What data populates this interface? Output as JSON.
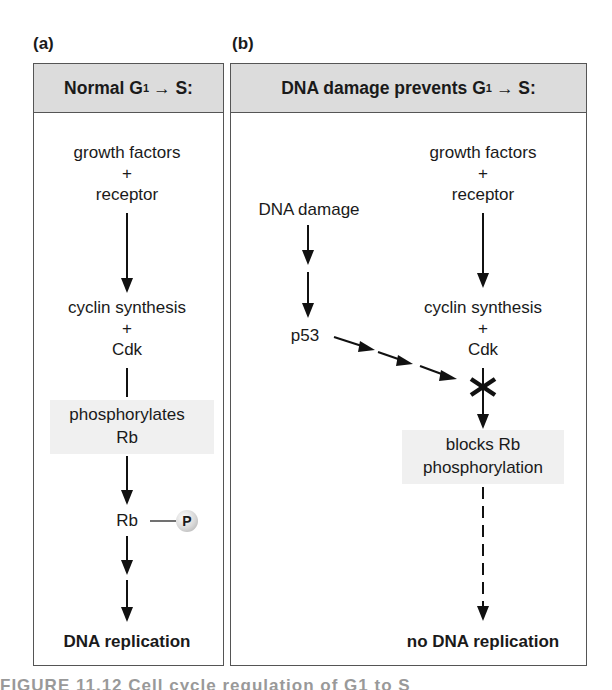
{
  "panel_a": {
    "label": "(a)",
    "header_pre": "Normal G",
    "header_sub": "1",
    "header_post": "→ S:",
    "steps": {
      "growth_factors": "growth factors",
      "plus1": "+",
      "receptor": "receptor",
      "cyclin_synthesis": "cyclin synthesis",
      "plus2": "+",
      "cdk": "Cdk",
      "phosphorylates": "phosphorylates",
      "rb": "Rb",
      "rb_p": "Rb",
      "p_symbol": "P",
      "result": "DNA replication"
    }
  },
  "panel_b": {
    "label": "(b)",
    "header_pre": "DNA damage prevents G",
    "header_sub": "1",
    "header_post": "→ S:",
    "steps": {
      "dna_damage": "DNA damage",
      "p53": "p53",
      "growth_factors": "growth factors",
      "plus1": "+",
      "receptor": "receptor",
      "cyclin_synthesis": "cyclin synthesis",
      "plus2": "+",
      "cdk": "Cdk",
      "blocks_rb": "blocks Rb",
      "phosphorylation": "phosphorylation",
      "result": "no DNA replication"
    }
  },
  "caption": "FIGURE 11.12 Cell cycle regulation of G1 to S"
}
